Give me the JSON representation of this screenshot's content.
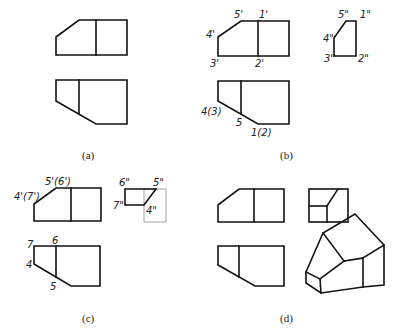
{
  "figure": {
    "panels": [
      {
        "id": "a",
        "caption": "(a)",
        "views": [
          "front-view",
          "top-view"
        ],
        "labels": []
      },
      {
        "id": "b",
        "caption": "(b)",
        "views": [
          "front-view",
          "side-view",
          "top-view"
        ],
        "labels": {
          "front": [
            "5'",
            "1'",
            "4'",
            "3'",
            "2'"
          ],
          "side": [
            "5\"",
            "1\"",
            "4\"",
            "3\"",
            "2\""
          ],
          "top": [
            "4(3)",
            "5",
            "1(2)"
          ]
        }
      },
      {
        "id": "c",
        "caption": "(c)",
        "views": [
          "front-view",
          "side-view",
          "top-view"
        ],
        "labels": {
          "front": [
            "5'(6')",
            "4'(7')"
          ],
          "side": [
            "6\"",
            "5\"",
            "7\"",
            "4\""
          ],
          "top": [
            "7",
            "6",
            "4",
            "5"
          ]
        }
      },
      {
        "id": "d",
        "caption": "(d)",
        "views": [
          "front-view",
          "side-view",
          "top-view",
          "isometric-view"
        ],
        "labels": []
      }
    ],
    "colors": {
      "line": "#111111",
      "construction": "#9a9a9a",
      "background": "#ffffff"
    }
  },
  "b_labels": {
    "f5": "5'",
    "f1": "1'",
    "f4": "4'",
    "f3": "3'",
    "f2": "2'",
    "s5": "5\"",
    "s1": "1\"",
    "s4": "4\"",
    "s3": "3\"",
    "s2": "2\"",
    "t43": "4(3)",
    "t5": "5",
    "t12": "1(2)"
  },
  "c_labels": {
    "f56": "5'(6')",
    "f47": "4'(7')",
    "s6": "6\"",
    "s5": "5\"",
    "s7": "7\"",
    "s4": "4\"",
    "t7": "7",
    "t6": "6",
    "t4": "4",
    "t5": "5"
  },
  "captions": {
    "a": "(a)",
    "b": "(b)",
    "c": "(c)",
    "d": "(d)"
  }
}
